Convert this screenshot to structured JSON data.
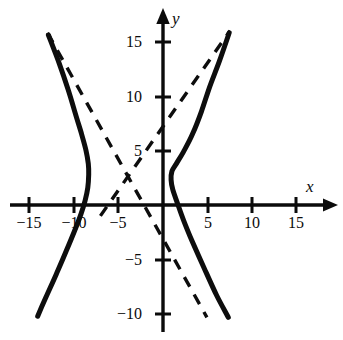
{
  "chart_data": {
    "type": "line",
    "title": "",
    "subtitle": "",
    "xlabel": "x",
    "ylabel": "y",
    "xlim": [
      -17.5,
      19.5
    ],
    "ylim": [
      -12.3,
      18.1
    ],
    "grid": false,
    "legend": null,
    "axis_style": "arrows-both-ends",
    "x_ticks": [
      -15,
      -10,
      -5,
      5,
      10,
      15
    ],
    "y_ticks": [
      15,
      10,
      5,
      -5,
      -10
    ],
    "x_tick_labels": [
      "−15",
      "−10",
      "−5",
      "5",
      "10",
      "15"
    ],
    "y_tick_labels": [
      "15",
      "10",
      "5",
      "−5",
      "−10"
    ],
    "annotations": [],
    "series": [
      {
        "name": "hyperbola-left-branch",
        "style": "solid",
        "color": "#0d0d0d",
        "linewidth": 4,
        "points": [
          [
            -12.8,
            15.6
          ],
          [
            -11.6,
            13.0
          ],
          [
            -10.6,
            10.6
          ],
          [
            -9.8,
            8.4
          ],
          [
            -9.1,
            6.5
          ],
          [
            -8.6,
            5.0
          ],
          [
            -8.35,
            3.8
          ],
          [
            -8.3,
            2.8
          ],
          [
            -8.4,
            1.6
          ],
          [
            -8.7,
            0.4
          ],
          [
            -9.2,
            -0.9
          ],
          [
            -9.9,
            -2.4
          ],
          [
            -10.8,
            -4.2
          ],
          [
            -11.9,
            -6.3
          ],
          [
            -13.1,
            -8.5
          ],
          [
            -14.0,
            -10.2
          ]
        ]
      },
      {
        "name": "hyperbola-right-branch",
        "style": "solid",
        "color": "#0d0d0d",
        "linewidth": 4,
        "points": [
          [
            7.4,
            15.8
          ],
          [
            6.3,
            13.2
          ],
          [
            5.2,
            10.8
          ],
          [
            4.3,
            8.6
          ],
          [
            3.3,
            6.5
          ],
          [
            2.3,
            4.9
          ],
          [
            1.5,
            3.8
          ],
          [
            1.0,
            3.1
          ],
          [
            0.9,
            2.3
          ],
          [
            1.1,
            1.4
          ],
          [
            1.6,
            0.2
          ],
          [
            2.3,
            -1.4
          ],
          [
            3.3,
            -3.4
          ],
          [
            4.6,
            -5.8
          ],
          [
            6.0,
            -8.3
          ],
          [
            7.3,
            -10.3
          ]
        ]
      },
      {
        "name": "asymptote-rising",
        "style": "dashed",
        "color": "#0d0d0d",
        "linewidth": 3,
        "points": [
          [
            -7.0,
            -1.0
          ],
          [
            7.5,
            16.0
          ]
        ]
      },
      {
        "name": "asymptote-falling",
        "style": "dashed",
        "color": "#0d0d0d",
        "linewidth": 3,
        "points": [
          [
            -12.9,
            15.8
          ],
          [
            4.9,
            -10.3
          ]
        ]
      }
    ]
  },
  "axes": {
    "x_axis_label": "x",
    "y_axis_label": "y"
  },
  "ticks": {
    "x": [
      {
        "value": -15,
        "label": "−15"
      },
      {
        "value": -10,
        "label": "−10"
      },
      {
        "value": -5,
        "label": "−5"
      },
      {
        "value": 5,
        "label": "5"
      },
      {
        "value": 10,
        "label": "10"
      },
      {
        "value": 15,
        "label": "15"
      }
    ],
    "y": [
      {
        "value": 15,
        "label": "15"
      },
      {
        "value": 10,
        "label": "10"
      },
      {
        "value": 5,
        "label": "5"
      },
      {
        "value": -5,
        "label": "−5"
      },
      {
        "value": -10,
        "label": "−10"
      }
    ]
  },
  "colors": {
    "curve": "#0d0d0d",
    "axis": "#0b0b0b",
    "background": "#ffffff"
  }
}
